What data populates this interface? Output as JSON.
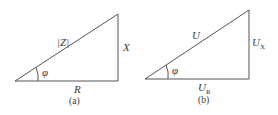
{
  "diagram": {
    "type": "right-triangle-pair",
    "panels": [
      {
        "caption": "(a)",
        "title": "Impedance triangle",
        "hypotenuse": "|Z|",
        "vertical": "X",
        "horizontal": "R",
        "angle": "φ"
      },
      {
        "caption": "(b)",
        "title": "Voltage triangle",
        "hypotenuse": "U",
        "vertical": "U",
        "vertical_sub": "X",
        "horizontal": "U",
        "horizontal_sub": "R",
        "angle": "φ"
      }
    ],
    "colors": {
      "line": "#555555",
      "text": "#3a3a3a",
      "background": "#ffffff"
    }
  }
}
